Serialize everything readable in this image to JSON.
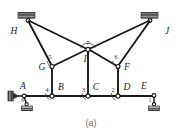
{
  "figure": {
    "caption": "(a)",
    "type": "planar-linkage-mechanism-diagram",
    "background_color": "#ffffff",
    "line_color": "#1a1a1a",
    "ground_block_color": "#b9b9b9"
  },
  "joint_labels": {
    "A": "A",
    "B": "B",
    "C": "C",
    "D": "D",
    "E": "E",
    "F": "F",
    "G": "G",
    "H": "H",
    "I": "I",
    "J": "J"
  },
  "link_numbers": {
    "one": "1",
    "two": "2",
    "three": "3",
    "four": "4",
    "five": "5",
    "six": "6",
    "seven": "7",
    "eight": "8"
  },
  "nodes": [
    {
      "id": "H",
      "label": "H",
      "x": 28,
      "y": 22,
      "kind": "fixed-support"
    },
    {
      "id": "J",
      "label": "J",
      "x": 150,
      "y": 22,
      "kind": "fixed-support"
    },
    {
      "id": "I",
      "label": "I",
      "x": 88,
      "y": 49,
      "kind": "pin"
    },
    {
      "id": "G",
      "label": "G",
      "x": 52,
      "y": 67,
      "kind": "pin"
    },
    {
      "id": "F",
      "label": "F",
      "x": 118,
      "y": 67,
      "kind": "pin"
    },
    {
      "id": "A",
      "label": "A",
      "x": 26,
      "y": 96,
      "kind": "slider-support"
    },
    {
      "id": "B",
      "label": "B",
      "x": 52,
      "y": 96,
      "kind": "pin"
    },
    {
      "id": "C",
      "label": "C",
      "x": 88,
      "y": 96,
      "kind": "pin"
    },
    {
      "id": "D",
      "label": "D",
      "x": 118,
      "y": 96,
      "kind": "pin"
    },
    {
      "id": "E",
      "label": "E",
      "x": 152,
      "y": 96,
      "kind": "fixed-support"
    }
  ],
  "members": [
    {
      "from": "H",
      "to": "G"
    },
    {
      "from": "H",
      "to": "I"
    },
    {
      "from": "G",
      "to": "I"
    },
    {
      "from": "J",
      "to": "F"
    },
    {
      "from": "J",
      "to": "I"
    },
    {
      "from": "F",
      "to": "I"
    },
    {
      "from": "G",
      "to": "B"
    },
    {
      "from": "F",
      "to": "D"
    },
    {
      "from": "I",
      "to": "C"
    },
    {
      "from": "A",
      "to": "E"
    }
  ]
}
